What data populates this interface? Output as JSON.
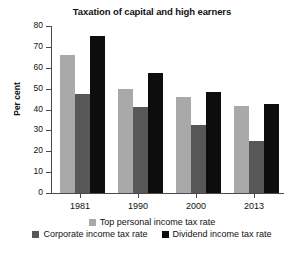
{
  "chart_data": {
    "type": "bar",
    "title": "Taxation of capital and high earners",
    "xlabel": "",
    "ylabel": "Per cent",
    "categories": [
      "1981",
      "1990",
      "2000",
      "2013"
    ],
    "series": [
      {
        "name": "Top personal income tax rate",
        "color": "#a9a9a9",
        "values": [
          66,
          50,
          46,
          41.5
        ]
      },
      {
        "name": "Corporate income tax rate",
        "color": "#575757",
        "values": [
          47.5,
          41,
          32.5,
          25
        ]
      },
      {
        "name": "Dividend income tax rate",
        "color": "#0d0d0d",
        "values": [
          75,
          57.5,
          48.5,
          42.5
        ]
      }
    ],
    "ylim": [
      0,
      80
    ],
    "yticks": [
      0,
      10,
      20,
      30,
      40,
      50,
      60,
      70,
      80
    ],
    "ytick_labels": [
      "0",
      "10",
      "20",
      "30",
      "40",
      "50",
      "60",
      "70",
      "80"
    ],
    "grid": false,
    "legend_position": "bottom"
  },
  "legend": {
    "rows": [
      [
        "Top personal income tax rate"
      ],
      [
        "Corporate income tax rate",
        "Dividend income tax rate"
      ]
    ]
  }
}
